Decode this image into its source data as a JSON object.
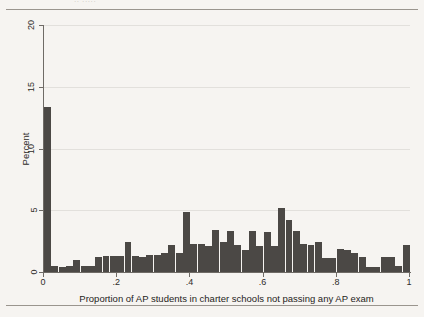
{
  "page": {
    "scan_top_text": "·· ·····",
    "background_color": "#f6f4f1"
  },
  "chart_data": {
    "type": "bar",
    "title": "",
    "subtitle": "",
    "xlabel": "Proportion of AP students in charter schools not passing any AP exam",
    "ylabel": "Percent",
    "xlim": [
      0,
      1
    ],
    "ylim": [
      0,
      20
    ],
    "grid": true,
    "legend": null,
    "bar_color": "#4b4845",
    "axis_color": "#6f6b66",
    "grid_color": "#e2e0dc",
    "xticks": [
      0,
      0.2,
      0.4,
      0.6,
      0.8,
      1
    ],
    "xticklabels": [
      "0",
      ".2",
      ".4",
      ".6",
      ".8",
      "1"
    ],
    "yticks": [
      0,
      5,
      10,
      15,
      20
    ],
    "yticklabels": [
      "0",
      "5",
      "10",
      "15",
      "20"
    ],
    "bin_width": 0.02,
    "x": [
      0.0,
      0.02,
      0.04,
      0.06,
      0.08,
      0.1,
      0.12,
      0.14,
      0.16,
      0.18,
      0.2,
      0.22,
      0.24,
      0.26,
      0.28,
      0.3,
      0.32,
      0.34,
      0.36,
      0.38,
      0.4,
      0.42,
      0.44,
      0.46,
      0.48,
      0.5,
      0.52,
      0.54,
      0.56,
      0.58,
      0.6,
      0.62,
      0.64,
      0.66,
      0.68,
      0.7,
      0.72,
      0.74,
      0.76,
      0.78,
      0.8,
      0.82,
      0.84,
      0.86,
      0.88,
      0.9,
      0.92,
      0.94,
      0.96,
      0.98
    ],
    "values": [
      13.4,
      0.5,
      0.4,
      0.5,
      1.0,
      0.5,
      0.5,
      1.2,
      1.3,
      1.3,
      1.3,
      2.4,
      1.3,
      1.2,
      1.4,
      1.4,
      1.5,
      2.2,
      1.5,
      4.9,
      2.3,
      2.3,
      2.1,
      3.4,
      2.4,
      3.3,
      2.2,
      1.8,
      3.3,
      2.1,
      3.2,
      2.1,
      5.2,
      4.2,
      3.3,
      2.3,
      2.2,
      2.4,
      1.1,
      1.1,
      1.9,
      1.8,
      1.5,
      1.2,
      0.4,
      0.4,
      1.2,
      1.2,
      0.5,
      2.2
    ]
  }
}
